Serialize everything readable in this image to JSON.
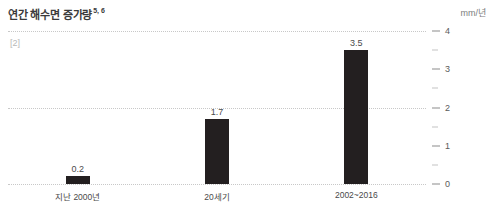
{
  "chart_data": {
    "type": "bar",
    "title": "연간 해수면 증가량",
    "title_superscript": "5, 6",
    "subtitle": "",
    "xlabel": "",
    "ylabel": "mm/년",
    "unit_label": "mm/년",
    "reference_note": "[2]",
    "categories": [
      "지난 2000년",
      "20세기",
      "2002~2016"
    ],
    "values": [
      0.2,
      1.7,
      3.5
    ],
    "value_labels": [
      "0.2",
      "1.7",
      "3.5"
    ],
    "ylim": [
      0,
      4
    ],
    "y_major_ticks": [
      0,
      1,
      2,
      3,
      4
    ],
    "y_major_tick_labels": [
      "0",
      "1",
      "2",
      "3",
      "4"
    ],
    "y_minor_ticks": [
      0.5,
      1.5,
      2.5,
      3.5
    ],
    "gridlines": [
      0,
      2,
      4
    ],
    "grid": true,
    "legend": "none",
    "axis_position": "right",
    "bar_color": "#231f20",
    "grid_color": "#c8c8c8",
    "background_color": "#ffffff"
  }
}
